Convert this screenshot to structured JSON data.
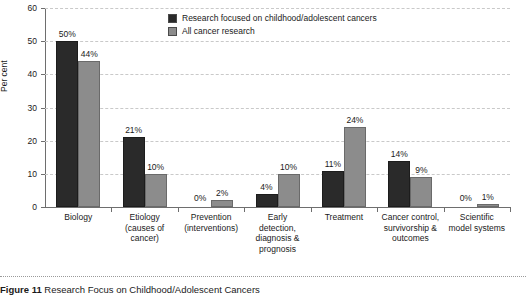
{
  "chart_data": {
    "type": "bar",
    "title": "",
    "xlabel": "",
    "ylabel": "Per cent",
    "ylim": [
      0,
      60
    ],
    "yticks": [
      0,
      10,
      20,
      30,
      40,
      50,
      60
    ],
    "grid": true,
    "legend_position": "top-center",
    "value_suffix": "%",
    "categories": [
      "Biology",
      "Etiology\n(causes of\ncancer)",
      "Prevention\n(interventions)",
      "Early\ndetection,\ndiagnosis &\nprognosis",
      "Treatment",
      "Cancer control,\nsurvivorship &\noutcomes",
      "Scientific\nmodel systems"
    ],
    "series": [
      {
        "name": "Research focused on childhood/adolescent cancers",
        "color": "#2a2a2a",
        "values": [
          50,
          21,
          0,
          4,
          11,
          14,
          0
        ],
        "labels": [
          "50%",
          "21%",
          "0%",
          "4%",
          "11%",
          "14%",
          "0%"
        ]
      },
      {
        "name": "All cancer research",
        "color": "#8c8c8c",
        "values": [
          44,
          10,
          2,
          10,
          24,
          9,
          1
        ],
        "labels": [
          "44%",
          "10%",
          "2%",
          "10%",
          "24%",
          "9%",
          "1%"
        ]
      }
    ]
  },
  "caption": {
    "number": "Figure 11",
    "text": "Research Focus on Childhood/Adolescent Cancers"
  }
}
